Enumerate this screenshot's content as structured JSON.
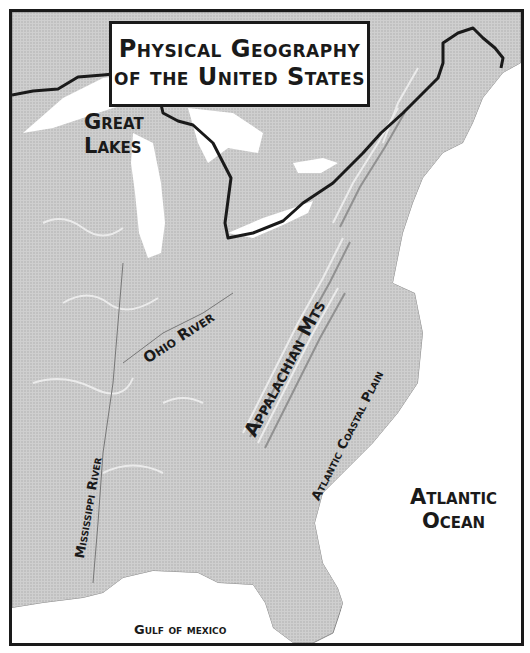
{
  "title": {
    "line1": "Physical Geography",
    "line2": "of the United States"
  },
  "labels": {
    "great_lakes": [
      "Great",
      "Lakes"
    ],
    "ohio_river": "Ohio River",
    "appalachian": "Appalachian Mts",
    "atlantic_coastal_plain": "Atlantic Coastal Plain",
    "mississippi_river": "Mississippi River",
    "atlantic_ocean": [
      "Atlantic",
      "Ocean"
    ],
    "gulf_of_mexico": "Gulf of mexico"
  },
  "colors": {
    "land": "#c9c9c9",
    "land_light": "#e2e2e2",
    "land_dark": "#9a9a9a",
    "water": "#ffffff",
    "border_line": "#1a1a1a",
    "text": "#1a1a1a"
  }
}
